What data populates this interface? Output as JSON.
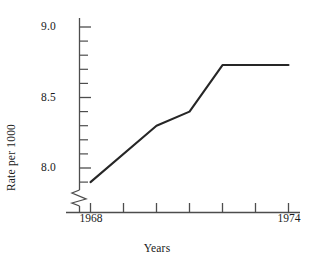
{
  "chart_data": {
    "type": "line",
    "title": "",
    "xlabel": "Years",
    "ylabel": "Rate per 1000",
    "x": [
      1968,
      1970,
      1971,
      1972,
      1974
    ],
    "values": [
      7.9,
      8.3,
      8.4,
      8.73,
      8.73
    ],
    "series": [
      {
        "name": "Rate per 1000",
        "x": [
          1968,
          1970,
          1971,
          1972,
          1974
        ],
        "values": [
          7.9,
          8.3,
          8.4,
          8.73,
          8.73
        ]
      }
    ],
    "xlim": [
      1968,
      1974
    ],
    "ylim": [
      7.75,
      9.05
    ],
    "x_major_ticks": [
      1968,
      1969,
      1970,
      1971,
      1972,
      1973,
      1974
    ],
    "x_tick_labels_shown": [
      "1968",
      "1974"
    ],
    "y_major_ticks": [
      8.0,
      8.5,
      9.0
    ],
    "y_major_tick_labels": [
      "8.0",
      "8.5",
      "9.0"
    ],
    "y_minor_tick_interval": 0.1,
    "grid": false,
    "legend": false,
    "legend_position": "none",
    "axis_break": true,
    "axis_break_note": "zigzag break symbol on y-axis below lowest minor tick",
    "line_color": "#262626",
    "axis_color": "#4d4d4d",
    "background_color": "#ffffff"
  },
  "axes": {
    "y_title": "Rate per 1000",
    "x_title": "Years",
    "y_labels": [
      {
        "text": "9.0",
        "value": 9.0
      },
      {
        "text": "8.5",
        "value": 8.5
      },
      {
        "text": "8.0",
        "value": 8.0
      }
    ],
    "x_labels": [
      {
        "text": "1968",
        "value": 1968
      },
      {
        "text": "1974",
        "value": 1974
      }
    ]
  }
}
